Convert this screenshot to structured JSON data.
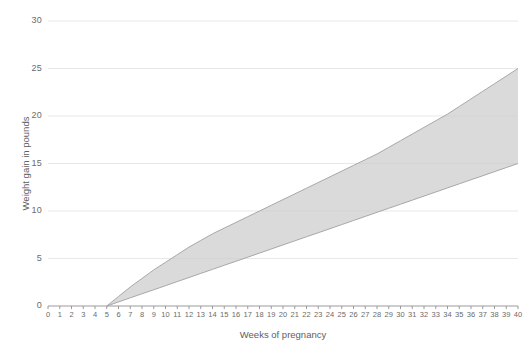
{
  "chart_data": {
    "type": "area",
    "title": "",
    "subtitle": "",
    "xlabel": "Weeks of pregnancy",
    "ylabel": "Weight gain in pounds",
    "xlim": [
      0,
      40
    ],
    "ylim": [
      0,
      30
    ],
    "grid": true,
    "legend_position": "none",
    "band_color": "#cdcdcd",
    "band_edge_color": "#a8a8a8",
    "axis_color": "#9a9a9a",
    "grid_color": "#e8e8e8",
    "text_color": "#5e5e5e",
    "x_tick_labels": [
      "0",
      "1",
      "2",
      "3",
      "4",
      "5",
      "6",
      "7",
      "8",
      "9",
      "10",
      "11",
      "12",
      "13",
      "14",
      "15",
      "16",
      "17",
      "18",
      "19",
      "20",
      "21",
      "22",
      "23",
      "24",
      "25",
      "26",
      "27",
      "28",
      "29",
      "30",
      "31",
      "32",
      "33",
      "34",
      "35",
      "36",
      "37",
      "38",
      "39",
      "40"
    ],
    "y_tick_labels": [
      "0",
      "5",
      "10",
      "15",
      "20",
      "25",
      "30"
    ],
    "y_ticks": [
      0,
      5,
      10,
      15,
      20,
      25,
      30
    ],
    "series": [
      {
        "name": "Upper recommended weight gain",
        "x": [
          5,
          6,
          7,
          8,
          9,
          10,
          11,
          12,
          13,
          14,
          15,
          16,
          17,
          18,
          19,
          20,
          21,
          22,
          23,
          24,
          25,
          26,
          27,
          28,
          29,
          30,
          31,
          32,
          33,
          34,
          35,
          36,
          37,
          38,
          39,
          40
        ],
        "values": [
          0,
          1.0,
          2.0,
          2.9,
          3.8,
          4.6,
          5.4,
          6.2,
          6.9,
          7.6,
          8.2,
          8.8,
          9.4,
          10.0,
          10.6,
          11.2,
          11.8,
          12.4,
          13.0,
          13.6,
          14.2,
          14.8,
          15.4,
          16.0,
          16.7,
          17.4,
          18.1,
          18.8,
          19.5,
          20.2,
          21.0,
          21.8,
          22.6,
          23.4,
          24.2,
          25.0
        ]
      },
      {
        "name": "Lower recommended weight gain",
        "x": [
          5,
          6,
          7,
          8,
          9,
          10,
          11,
          12,
          13,
          14,
          15,
          16,
          17,
          18,
          19,
          20,
          21,
          22,
          23,
          24,
          25,
          26,
          27,
          28,
          29,
          30,
          31,
          32,
          33,
          34,
          35,
          36,
          37,
          38,
          39,
          40
        ],
        "values": [
          0,
          0.43,
          0.86,
          1.29,
          1.71,
          2.14,
          2.57,
          3.0,
          3.43,
          3.86,
          4.29,
          4.71,
          5.14,
          5.57,
          6.0,
          6.43,
          6.86,
          7.29,
          7.71,
          8.14,
          8.57,
          9.0,
          9.43,
          9.86,
          10.29,
          10.71,
          11.14,
          11.57,
          12.0,
          12.43,
          12.86,
          13.29,
          13.71,
          14.14,
          14.57,
          15.0
        ]
      }
    ]
  }
}
